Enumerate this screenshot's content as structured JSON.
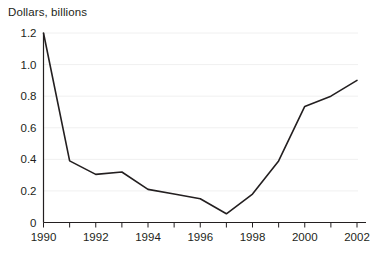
{
  "chart_data": {
    "type": "line",
    "title": "Dollars, billions",
    "xlabel": "",
    "ylabel": "Dollars, billions",
    "x": [
      1990,
      1991,
      1992,
      1993,
      1994,
      1995,
      1996,
      1997,
      1998,
      1999,
      2000,
      2001,
      2002
    ],
    "values": [
      1.2,
      0.39,
      0.305,
      0.32,
      0.21,
      0.18,
      0.15,
      0.055,
      0.18,
      0.39,
      0.735,
      0.8,
      0.9
    ],
    "series": [
      {
        "name": "Dollars, billions",
        "values": [
          1.2,
          0.39,
          0.305,
          0.32,
          0.21,
          0.18,
          0.15,
          0.055,
          0.18,
          0.39,
          0.735,
          0.8,
          0.9
        ]
      }
    ],
    "xlim": [
      1990,
      2002
    ],
    "ylim": [
      0,
      1.2
    ],
    "ytick_labels": [
      "0",
      "0.2",
      "0.4",
      "0.6",
      "0.8",
      "1.0",
      "1.2"
    ],
    "ytick_values": [
      0,
      0.2,
      0.4,
      0.6,
      0.8,
      1.0,
      1.2
    ],
    "xtick_values": [
      1990,
      1991,
      1992,
      1993,
      1994,
      1995,
      1996,
      1997,
      1998,
      1999,
      2000,
      2001,
      2002
    ],
    "xtick_labels": [
      "1990",
      "",
      "1992",
      "",
      "1994",
      "",
      "1996",
      "",
      "1998",
      "",
      "2000",
      "",
      "2002"
    ],
    "grid": true,
    "legend": "none",
    "line_color": "#231f20",
    "grid_color": "#f0f0f0",
    "background_color": "#ffffff"
  },
  "axis_title": "Dollars, billions"
}
